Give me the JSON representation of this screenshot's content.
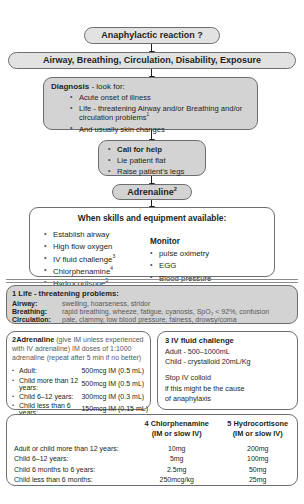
{
  "flow": {
    "anaphylactic": {
      "label": "Anaphylactic reaction ?"
    },
    "abcde": {
      "label": "Airway, Breathing, Circulation, Disability, Exposure"
    },
    "diagnosis": {
      "heading_bold": "Diagnosis",
      "heading_rest": " - look for:",
      "items": [
        "Acute onset of illness",
        "Life - threatening Airway and/or Breathing and/or circulation problems",
        "And usually skin changes"
      ],
      "item2_superscript": "1"
    },
    "call_for_help": {
      "items": [
        "Call for help",
        "Lie patient flat",
        "Raise patient's legs"
      ]
    },
    "adrenaline": {
      "label": "Adrenaline",
      "superscript": "2"
    },
    "skills": {
      "heading": "When skills and equipment available:",
      "left_items": [
        {
          "text": "Establish airway",
          "sup": ""
        },
        {
          "text": "High flow oxygen",
          "sup": ""
        },
        {
          "text": "IV fluid challenge",
          "sup": "3"
        },
        {
          "text": "Chlorphenamine",
          "sup": "4"
        },
        {
          "text": "Hydrocortisone",
          "sup": "5"
        }
      ],
      "monitor_heading": "Monitor",
      "monitor_items": [
        "pulse oximetry",
        "EGG",
        "Blood pressure"
      ]
    }
  },
  "life_threatening": {
    "note_marker": "1",
    "heading": "Life - threatening problems:",
    "rows": [
      {
        "key": "Airway:",
        "value": "swelling, hoarseness, stridor"
      },
      {
        "key": "Breathing:",
        "value": "rapid breathing, wheeze, fatigue, cyanosis, SpO₂ < 92%, confusion"
      },
      {
        "key": "Circulation:",
        "value": "pale, clammy, low blood pressure, fainess, drowsy/coma"
      }
    ]
  },
  "adrenaline_box": {
    "number": "2",
    "title": "Adrenaline",
    "note_line1": " (give IM unless experienced with IV",
    "note_line2": "adrenaline) IM doses of 1:1000 adrenaline (repeat after",
    "note_line3": "5 min if no better)",
    "doses": [
      {
        "group": "Adult:",
        "dose": "500mcg IM (0.5 mL)"
      },
      {
        "group": "Child more than 12 years:",
        "dose": "500mcg IM (0.5 mL)"
      },
      {
        "group": "Child 6–12 years:",
        "dose": "300mcg IM (0.3 mL)"
      },
      {
        "group": "Child less than 6 years:",
        "dose": "150mcg IM (0.15 mL)"
      }
    ]
  },
  "iv_fluid_box": {
    "number": "3",
    "title": "IV fluid challenge",
    "lines": [
      "Adult - 500–1000mL",
      "Child - crystalloid 20mL/Kg"
    ],
    "lines2": [
      "Stop IV colloid",
      "if this might be the cause",
      "of anaphylaxis"
    ]
  },
  "dose_table": {
    "col_blank": "",
    "col2_num": "4",
    "col2_title": "Chlorphenamine",
    "col2_sub": "(IM or slow IV)",
    "col3_num": "5",
    "col3_title": "Hydrocortisone",
    "col3_sub": "(IM or slow IV)",
    "rows": [
      {
        "label": "Adult or child more than 12 years:",
        "chlor": "10mg",
        "hydro": "200mg"
      },
      {
        "label": "Child 6–12 years:",
        "chlor": "5mg",
        "hydro": "100mg"
      },
      {
        "label": "Child 6 months to 6 years:",
        "chlor": "2.5mg",
        "hydro": "50mg"
      },
      {
        "label": "Child less than 6 months:",
        "chlor": "250mcg/kg",
        "hydro": "25mg"
      }
    ]
  },
  "colors": {
    "box_fill_grey": "#d3d3d3",
    "box_fill_light": "#e2e2e2",
    "border": "#6d6e71",
    "text": "#231f20"
  }
}
